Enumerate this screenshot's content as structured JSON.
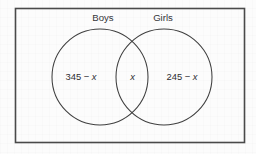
{
  "figure": {
    "type": "venn-diagram",
    "title": "",
    "frame": {
      "border_color": "#4a4a4a"
    },
    "background_color": "#fcfcfc",
    "sets": [
      {
        "id": "boys",
        "label": "Boys",
        "region_text": "345 − x",
        "region_number": "345 − ",
        "region_variable": "x"
      },
      {
        "id": "girls",
        "label": "Girls",
        "region_text": "245 − x",
        "region_number": "245 − ",
        "region_variable": "x"
      }
    ],
    "intersection": {
      "id": "both",
      "label": "",
      "region_text": "x",
      "region_variable": "x"
    },
    "stroke_color": "#3f3f3f"
  }
}
